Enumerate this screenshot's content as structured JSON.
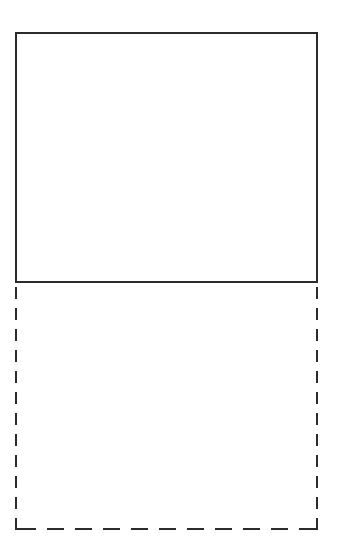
{
  "figure": {
    "background_color": "#ffffff",
    "stroke_color": "#2b2b2b",
    "canvas": {
      "width": 339,
      "height": 556
    },
    "shapes": [
      {
        "name": "upper-solid-rectangle",
        "shape": "rectangle",
        "border_style": "solid",
        "stroke_color": "#2b2b2b",
        "stroke_width": 2,
        "fill": "none",
        "x": 15,
        "y": 32,
        "width": 303,
        "height": 251,
        "label": ""
      },
      {
        "name": "lower-dashed-rectangle",
        "shape": "rectangle",
        "border_style": "dashed",
        "stroke_color": "#2b2b2b",
        "stroke_width": 2,
        "fill": "none",
        "x": 15,
        "y": 283,
        "width": 303,
        "height": 247,
        "dash_vertical": "12px dash / 9px gap",
        "dash_horizontal": "17px dash / 11px gap",
        "top_edge_shared_with": "upper-solid-rectangle",
        "label": ""
      }
    ]
  }
}
